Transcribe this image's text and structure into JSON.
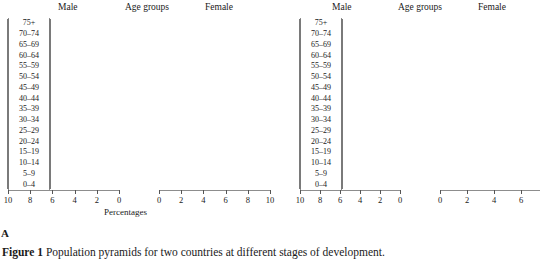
{
  "caption": {
    "label": "Figure 1",
    "text": "Population pyramids for two countries at different stages of development."
  },
  "headers": {
    "male": "Male",
    "age_groups": "Age groups",
    "female": "Female",
    "percentages": "Percentages"
  },
  "panels": [
    {
      "letter": "A"
    },
    {
      "letter": "B"
    }
  ],
  "chart_data": [
    {
      "type": "bar",
      "subtype": "population-pyramid",
      "panel": "A",
      "title": "",
      "xlabel": "Percentages",
      "ylabel": "Age groups",
      "categories": [
        "75+",
        "70–74",
        "65–69",
        "60–64",
        "55–59",
        "50–54",
        "45–49",
        "40–44",
        "35–39",
        "30–34",
        "25–29",
        "20–24",
        "15–19",
        "10–14",
        "5–9",
        "0–4"
      ],
      "series": [
        {
          "name": "Male",
          "direction": "left",
          "color": "#cdcdcd",
          "values": [
            0.3,
            0.6,
            0.9,
            1.2,
            1.5,
            1.8,
            2.1,
            2.4,
            2.8,
            3.3,
            3.9,
            4.4,
            5.0,
            5.6,
            6.2,
            6.8
          ]
        },
        {
          "name": "Female",
          "direction": "right",
          "color": "#868686",
          "values": [
            0.35,
            0.65,
            0.95,
            1.25,
            1.55,
            1.85,
            2.15,
            2.5,
            2.9,
            3.4,
            3.9,
            4.4,
            5.0,
            5.5,
            6.0,
            6.4
          ]
        }
      ],
      "left_axis_ticks": [
        10,
        8,
        6,
        4,
        2,
        0
      ],
      "right_axis_ticks": [
        0,
        2,
        4,
        6,
        8,
        10
      ],
      "xlim_left": [
        0,
        10
      ],
      "xlim_right": [
        0,
        10
      ],
      "grid": false,
      "legend": "top-labels"
    },
    {
      "type": "bar",
      "subtype": "population-pyramid",
      "panel": "B",
      "title": "",
      "xlabel": "Percentages",
      "ylabel": "Age groups",
      "categories": [
        "75+",
        "70–74",
        "65–69",
        "60–64",
        "55–59",
        "50–54",
        "45–49",
        "40–44",
        "35–39",
        "30–34",
        "25–29",
        "20–24",
        "15–19",
        "10–14",
        "5–9",
        "0–4"
      ],
      "series": [
        {
          "name": "Male",
          "direction": "left",
          "color": "#cdcdcd",
          "values": [
            1.5,
            1.3,
            1.8,
            2.1,
            2.2,
            2.4,
            2.8,
            3.2,
            3.3,
            4.0,
            3.5,
            3.4,
            2.9,
            2.9,
            3.4,
            3.3
          ]
        },
        {
          "name": "Female",
          "direction": "right",
          "color": "#868686",
          "values": [
            2.9,
            1.2,
            2.1,
            2.3,
            2.3,
            2.1,
            2.8,
            3.4,
            3.4,
            4.0,
            3.6,
            3.5,
            2.9,
            2.9,
            3.5,
            2.6
          ]
        }
      ],
      "left_axis_ticks": [
        10,
        8,
        6,
        4,
        2,
        0
      ],
      "right_axis_ticks": [
        0,
        2,
        4,
        6
      ],
      "xlim_left": [
        0,
        10
      ],
      "xlim_right": [
        0,
        7.4
      ],
      "grid": false,
      "legend": "top-labels"
    }
  ]
}
